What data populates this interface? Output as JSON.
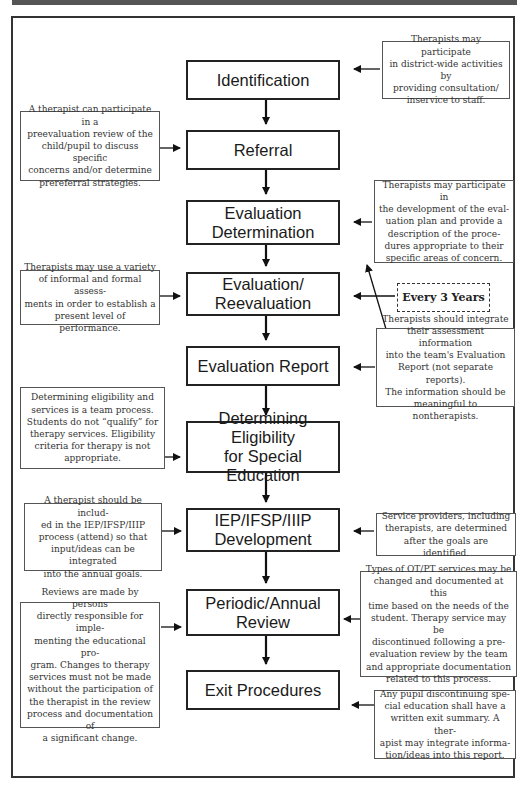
{
  "diagram": {
    "type": "flowchart",
    "steps": [
      {
        "id": "identification",
        "label": "Identification"
      },
      {
        "id": "referral",
        "label": "Referral"
      },
      {
        "id": "evaluation-determination",
        "label": "Evaluation\nDetermination"
      },
      {
        "id": "evaluation-reevaluation",
        "label": "Evaluation/\nReevaluation"
      },
      {
        "id": "evaluation-report",
        "label": "Evaluation Report"
      },
      {
        "id": "determining-eligibility",
        "label": "Determining Eligibility\nfor Special Education"
      },
      {
        "id": "iep-development",
        "label": "IEP/IFSP/IIIP\nDevelopment"
      },
      {
        "id": "periodic-review",
        "label": "Periodic/Annual\nReview"
      },
      {
        "id": "exit-procedures",
        "label": "Exit Procedures"
      }
    ],
    "notes": {
      "identification": "Therapists may participate\nin district-wide activities by\nproviding consultation/\ninservice to staff.",
      "referral": "A therapist can participate in a\npreevaluation review of the\nchild/pupil to discuss specific\nconcerns and/or determine\nprereferral strategies.",
      "evaluation_determination": "Therapists may participate in\nthe development of the eval-\nuation plan and provide a\ndescription of the proce-\ndures appropriate to their\nspecific areas of concern.",
      "evaluation_reevaluation": "Therapists may use a variety\nof informal and formal assess-\nments in order to establish a\npresent level of performance.",
      "evaluation_report": "Therapists should integrate\ntheir assessment information\ninto the team's Evaluation\nReport (not separate reports).\nThe information should be\nmeaningful to nontherapists.",
      "determining_eligibility": "Determining eligibility and\nservices is a team process.\nStudents do not “qualify” for\ntherapy services. Eligibility\ncriteria for therapy is not\nappropriate.",
      "iep_left": "A therapist should be includ-\ned in the IEP/IFSP/IIIP\nprocess (attend) so that\ninput/ideas can be integrated\ninto the annual goals.",
      "iep_right": "Service providers, including\ntherapists, are determined\nafter the goals are identified.",
      "periodic_right": "Types of OT/PT services may be\nchanged and documented at this\ntime based on the needs of the\nstudent. Therapy service may be\ndiscontinued following a pre-\nevaluation review by the team\nand appropriate documentation\nrelated to this process.",
      "periodic_left": "Reviews are made by persons\ndirectly responsible for imple-\nmenting the educational pro-\ngram. Changes to therapy\nservices must not be made\nwithout the participation of\nthe therapist in the review\nprocess and documentation of\na significant change.",
      "exit": "Any pupil discontinuing spe-\ncial education shall have a\nwritten exit summary. A ther-\napist may integrate informa-\ntion/ideas into this report."
    },
    "cycle_label": "Every 3 Years"
  }
}
